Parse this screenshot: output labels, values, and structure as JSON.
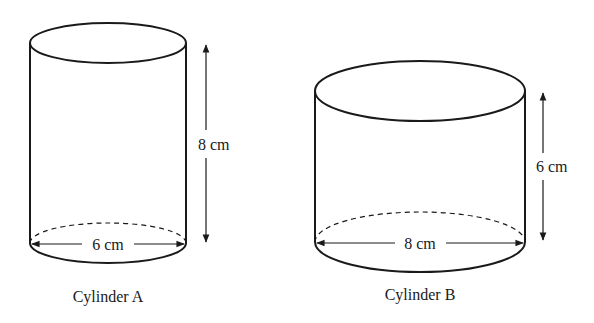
{
  "figure": {
    "cylinders": [
      {
        "name": "Cylinder A",
        "caption": "Cylinder A",
        "diameter_label": "6 cm",
        "height_label": "8 cm",
        "diameter_cm": 6,
        "height_cm": 8
      },
      {
        "name": "Cylinder B",
        "caption": "Cylinder B",
        "diameter_label": "8 cm",
        "height_label": "6 cm",
        "diameter_cm": 8,
        "height_cm": 6
      }
    ],
    "colors": {
      "stroke": "#1a1a1a",
      "background": "#ffffff"
    }
  }
}
